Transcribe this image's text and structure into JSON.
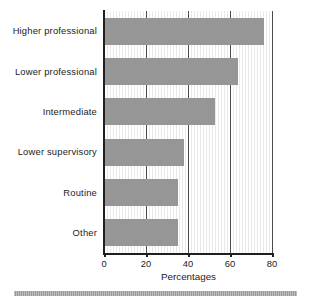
{
  "chart_data": {
    "type": "bar",
    "orientation": "horizontal",
    "title": "",
    "subtitle": "",
    "xlabel": "Percentages",
    "ylabel": "",
    "categories": [
      "Higher professional",
      "Lower professional",
      "Intermediate",
      "Lower supervisory",
      "Routine",
      "Other"
    ],
    "values": [
      76,
      64,
      53,
      38,
      35,
      35
    ],
    "xlim": [
      0,
      80
    ],
    "xticks": [
      0,
      20,
      40,
      60,
      80
    ],
    "xtick_labels": [
      "0",
      "20",
      "40",
      "60",
      "80"
    ],
    "gridlines": [
      20,
      40,
      60,
      80
    ],
    "grid": true,
    "legend": null,
    "bar_color": "#969696",
    "axis_color": "#1f1f1f",
    "background_color": "#ffffff"
  },
  "figure": {
    "footer_rule_color": "#9a9a9a"
  }
}
